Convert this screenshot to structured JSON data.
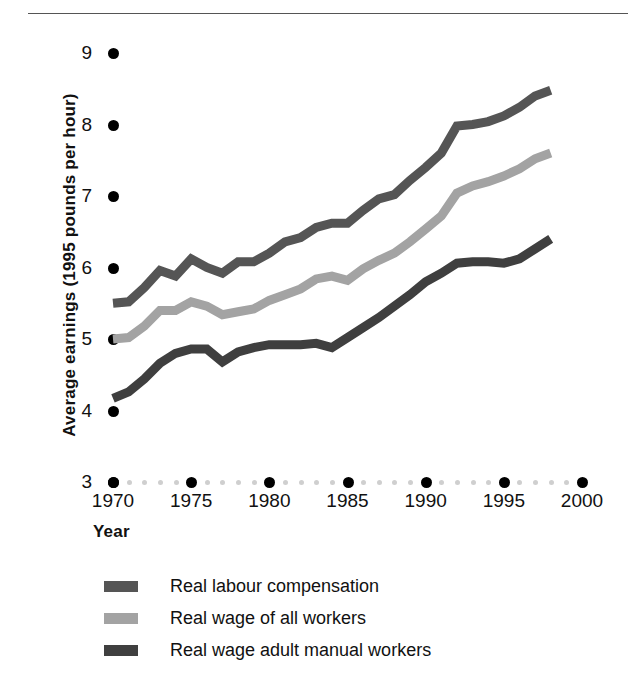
{
  "axes": {
    "y_title": "Average earnings (1995 pounds per hour)",
    "x_title": "Year",
    "y_ticks": [
      "9",
      "8",
      "7",
      "6",
      "5",
      "4",
      "3"
    ],
    "x_ticks": [
      "1970",
      "1975",
      "1980",
      "1985",
      "1990",
      "1995",
      "2000"
    ]
  },
  "legend": {
    "items": [
      {
        "label": "Real labour compensation",
        "color": "#555555"
      },
      {
        "label": "Real wage of all workers",
        "color": "#a3a3a3"
      },
      {
        "label": "Real wage adult manual workers",
        "color": "#3f3f3f"
      }
    ]
  },
  "chart_data": {
    "type": "line",
    "title": "",
    "xlabel": "Year",
    "ylabel": "Average earnings (1995 pounds per hour)",
    "xlim": [
      1970,
      2000
    ],
    "ylim": [
      3,
      9
    ],
    "grid": false,
    "legend_position": "bottom",
    "x": [
      1970,
      1971,
      1972,
      1973,
      1974,
      1975,
      1976,
      1977,
      1978,
      1979,
      1980,
      1981,
      1982,
      1983,
      1984,
      1985,
      1986,
      1987,
      1988,
      1989,
      1990,
      1991,
      1992,
      1993,
      1994,
      1995,
      1996,
      1997,
      1998
    ],
    "series": [
      {
        "name": "Real labour compensation",
        "color": "#555555",
        "values": [
          5.5,
          5.52,
          5.72,
          5.96,
          5.88,
          6.12,
          6.0,
          5.92,
          6.08,
          6.08,
          6.2,
          6.36,
          6.42,
          6.56,
          6.62,
          6.62,
          6.8,
          6.96,
          7.02,
          7.22,
          7.4,
          7.6,
          7.98,
          8.0,
          8.04,
          8.12,
          8.24,
          8.4,
          8.48
        ]
      },
      {
        "name": "Real wage of all workers",
        "color": "#a3a3a3",
        "values": [
          5.0,
          5.02,
          5.18,
          5.4,
          5.4,
          5.52,
          5.46,
          5.34,
          5.38,
          5.42,
          5.54,
          5.62,
          5.7,
          5.84,
          5.88,
          5.82,
          5.98,
          6.1,
          6.2,
          6.36,
          6.54,
          6.72,
          7.04,
          7.14,
          7.2,
          7.28,
          7.38,
          7.52,
          7.6
        ]
      },
      {
        "name": "Real wage adult manual workers",
        "color": "#3f3f3f",
        "values": [
          4.17,
          4.26,
          4.44,
          4.66,
          4.8,
          4.86,
          4.86,
          4.68,
          4.82,
          4.88,
          4.92,
          4.92,
          4.92,
          4.94,
          4.88,
          5.02,
          5.16,
          5.3,
          5.46,
          5.62,
          5.8,
          5.92,
          6.06,
          6.08,
          6.08,
          6.06,
          6.12,
          6.26,
          6.4
        ]
      }
    ]
  }
}
